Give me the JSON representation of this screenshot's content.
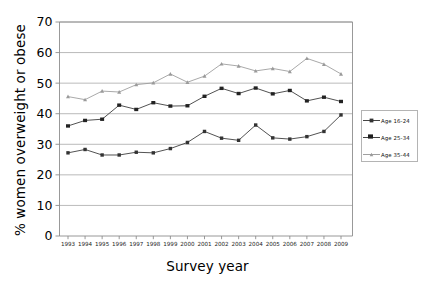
{
  "chart_data": {
    "type": "line",
    "title": "",
    "xlabel": "Survey year",
    "ylabel": "% women overweight or obese",
    "xlim": [
      1993,
      2009
    ],
    "ylim": [
      0,
      70
    ],
    "ytick_step": 10,
    "grid": true,
    "legend_position": "right",
    "categories": [
      "1993",
      "1994",
      "1995",
      "1996",
      "1997",
      "1998",
      "1999",
      "2000",
      "2001",
      "2002",
      "2003",
      "2004",
      "2005",
      "2006",
      "2007",
      "2008",
      "2009"
    ],
    "yticks": [
      "0",
      "10",
      "20",
      "30",
      "40",
      "50",
      "60",
      "70"
    ],
    "series": [
      {
        "name": "Age 16-24",
        "marker": "square-small-dark",
        "color": "#333333",
        "values": [
          27.2,
          28.3,
          26.5,
          26.5,
          27.4,
          27.2,
          28.6,
          30.6,
          34.2,
          32.0,
          31.3,
          36.3,
          32.1,
          31.7,
          32.5,
          34.2,
          39.6
        ]
      },
      {
        "name": "Age 25-34",
        "marker": "square-bold-dark",
        "color": "#222222",
        "values": [
          36.0,
          37.8,
          38.2,
          42.8,
          41.4,
          43.6,
          42.5,
          42.6,
          45.7,
          48.3,
          46.6,
          48.4,
          46.5,
          47.6,
          44.2,
          45.4,
          44.0
        ]
      },
      {
        "name": "Age 35-44",
        "marker": "triangle-light",
        "color": "#9a9a9a",
        "values": [
          45.6,
          44.6,
          47.4,
          47.1,
          49.5,
          50.1,
          53.0,
          50.3,
          52.3,
          56.3,
          55.6,
          54.0,
          54.8,
          53.8,
          58.1,
          56.2,
          53.0
        ]
      }
    ]
  },
  "axes": {
    "y_title": "% women overweight or obese",
    "x_title": "Survey year"
  },
  "legend": {
    "items": [
      {
        "label": "Age 16-24"
      },
      {
        "label": "Age 25-34"
      },
      {
        "label": "Age 35-44"
      }
    ]
  },
  "colors": {
    "grid": "#a8a8a8",
    "axis": "#8d8d8d",
    "series_dark": "#333333",
    "series_light": "#9a9a9a",
    "background": "#ffffff"
  }
}
